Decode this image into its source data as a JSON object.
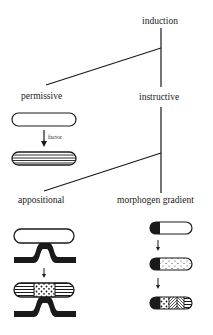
{
  "diagram": {
    "root": {
      "label": "induction"
    },
    "branches": [
      {
        "label": "permissive"
      },
      {
        "label": "instructive"
      }
    ],
    "instructive_subbranches": [
      {
        "label": "appositional"
      },
      {
        "label": "morphogen gradient"
      }
    ],
    "permissive_panel": {
      "arrow_label": "factor"
    },
    "colors": {
      "ink": "#1a1a1a",
      "background": "#ffffff"
    }
  }
}
